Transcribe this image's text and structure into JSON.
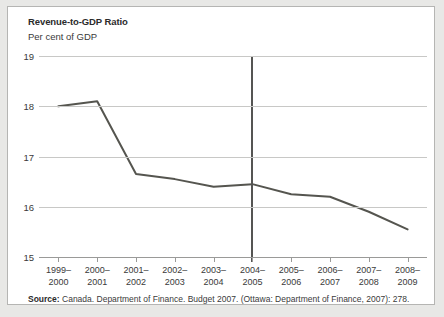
{
  "figure": {
    "title": "Revenue-to-GDP Ratio",
    "subtitle": "Per cent of GDP",
    "source_label": "Source:",
    "source_text": " Canada. Department of Finance. Budget 2007. (Ottawa: Department of Finance, 2007): 278."
  },
  "chart_data": {
    "type": "line",
    "title": "Revenue-to-GDP Ratio",
    "subtitle": "Per cent of GDP",
    "xlabel": "",
    "ylabel": "Per cent of GDP",
    "categories": [
      "1999–2000",
      "2000–2001",
      "2001–2002",
      "2002–2003",
      "2003–2004",
      "2004–2005",
      "2005–2006",
      "2006–2007",
      "2007–2008",
      "2008–2009"
    ],
    "category_lines": [
      [
        "1999–",
        "2000"
      ],
      [
        "2000–",
        "2001"
      ],
      [
        "2001–",
        "2002"
      ],
      [
        "2002–",
        "2003"
      ],
      [
        "2003–",
        "2004"
      ],
      [
        "2004–",
        "2005"
      ],
      [
        "2005–",
        "2006"
      ],
      [
        "2006–",
        "2007"
      ],
      [
        "2007–",
        "2008"
      ],
      [
        "2008–",
        "2009"
      ]
    ],
    "values": [
      18.0,
      18.1,
      16.65,
      16.55,
      16.4,
      16.45,
      16.25,
      16.2,
      15.9,
      15.55
    ],
    "ylim": [
      15,
      19
    ],
    "yticks": [
      19,
      18,
      17,
      16,
      15
    ],
    "ytick_labels": [
      "19",
      "18",
      "17",
      "16",
      "15"
    ],
    "grid": true,
    "legend": "none",
    "series_color": "#55554f",
    "grid_color": "#c8c8c6",
    "annotations": [
      {
        "type": "vertical-line",
        "at_category": "2004–2005",
        "label": "",
        "color": "#555553"
      }
    ]
  }
}
